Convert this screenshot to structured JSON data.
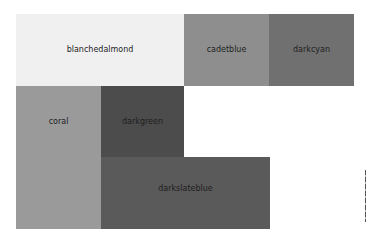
{
  "chart_data": {
    "type": "treemap",
    "title": "",
    "items": [
      {
        "label": "blanchedalmond",
        "color": "#f0f0f0",
        "x": 16,
        "y": 14,
        "w": 168,
        "h": 72,
        "label_y": 36
      },
      {
        "label": "cadetblue",
        "color": "#8e8e8e",
        "x": 184,
        "y": 14,
        "w": 85,
        "h": 72,
        "label_y": 36
      },
      {
        "label": "darkcyan",
        "color": "#707070",
        "x": 269,
        "y": 14,
        "w": 85,
        "h": 72,
        "label_y": 36
      },
      {
        "label": "coral",
        "color": "#9a9a9a",
        "x": 16,
        "y": 86,
        "w": 85,
        "h": 143,
        "label_y": 36
      },
      {
        "label": "darkgreen",
        "color": "#4c4c4c",
        "x": 101,
        "y": 86,
        "w": 83,
        "h": 71,
        "label_y": 36
      },
      {
        "label": "darkslateblue",
        "color": "#5a5a5a",
        "x": 101,
        "y": 157,
        "w": 169,
        "h": 72,
        "label_y": 32
      }
    ]
  }
}
